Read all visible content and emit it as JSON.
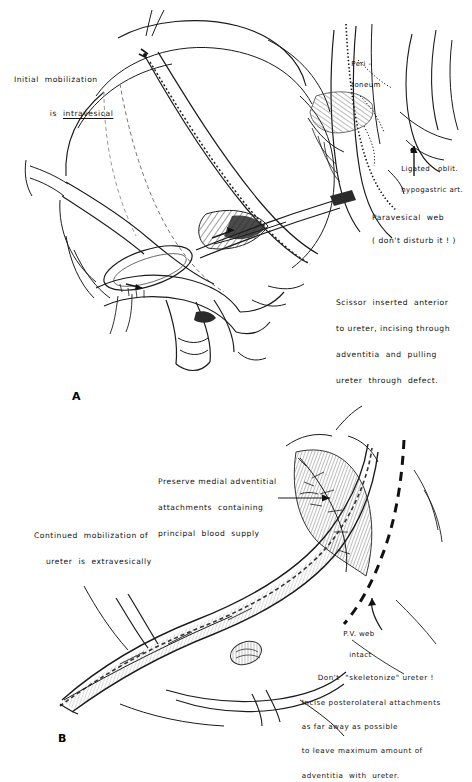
{
  "figure": {
    "kind": "surgical-line-illustration",
    "background": "#ffffff",
    "ink_color": "#1b1b1b",
    "panels": [
      {
        "id": "A",
        "label": "A",
        "subject": "Intravesical mobilization of the ureter with scissor through paravesical web"
      },
      {
        "id": "B",
        "label": "B",
        "subject": "Extravesical continued mobilization preserving medial adventitia"
      }
    ]
  },
  "panel_a": {
    "label": "A",
    "annotations": {
      "initial": {
        "line1": "Initial  mobilization",
        "line2_prefix": "is  ",
        "line2_underlined": "intravesical"
      },
      "peritoneum": {
        "line1": "Peri -",
        "line2": "toneum"
      },
      "ligated": {
        "line1": "Ligated   oblit.",
        "line2": "hypogastric art."
      },
      "paravesical": {
        "line1": "Paravesical  web",
        "line2": "( don't disturb it ! )"
      },
      "scissor": {
        "line1": "Scissor  inserted  anterior",
        "line2": "to ureter, incising through",
        "line3": "adventitia  and  pulling",
        "line4": "ureter  through  defect."
      }
    }
  },
  "panel_b": {
    "label": "B",
    "annotations": {
      "preserve": {
        "line1": "Preserve medial adventitial",
        "line2": "attachments  containing",
        "line3": "principal  blood  supply"
      },
      "continued": {
        "line1": "Continued  mobilization of",
        "line2": "ureter  is  extravesically"
      },
      "pvweb": {
        "line1": "P.V. web",
        "line2": "intact"
      },
      "dont_skeletonize": {
        "line1": "Don't  \"skeletonize\" ureter !",
        "line2": "Incise posterolateral attachments",
        "line3": "as far away as possible",
        "line4": "to leave maximum amount of",
        "line5": "adventitia  with  ureter."
      }
    }
  }
}
